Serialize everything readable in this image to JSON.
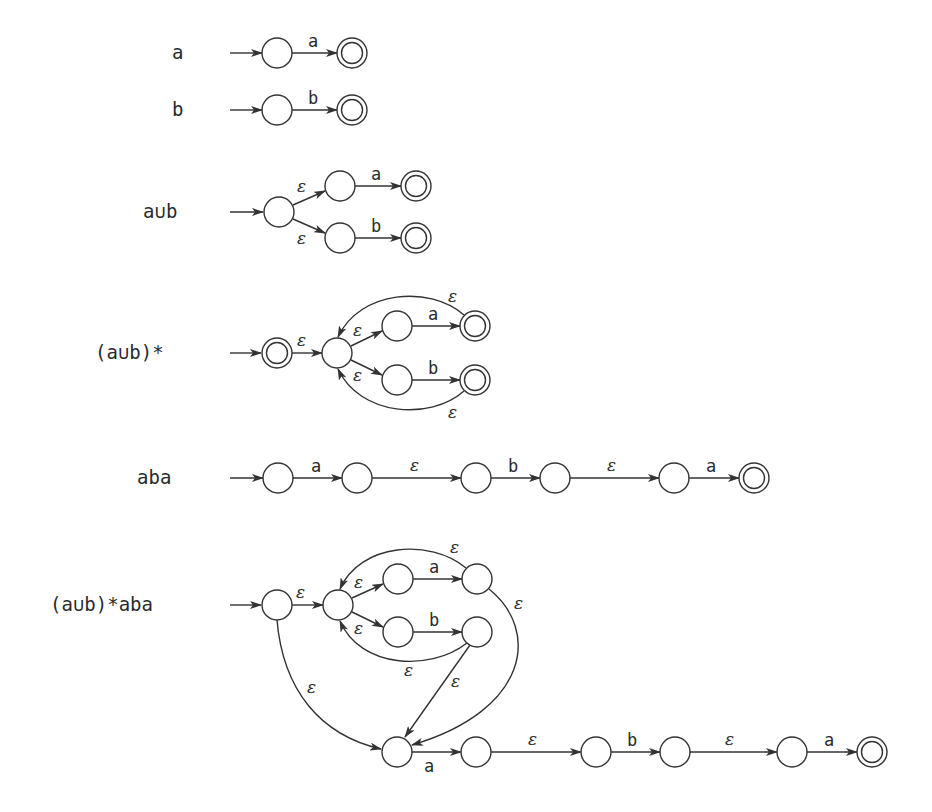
{
  "figure": {
    "rows": [
      {
        "regex": "a",
        "edges": [
          {
            "label": "a"
          }
        ]
      },
      {
        "regex": "b",
        "edges": [
          {
            "label": "b"
          }
        ]
      },
      {
        "regex": "a∪b",
        "edges": [
          {
            "label": "ε"
          },
          {
            "label": "ε"
          },
          {
            "label": "a"
          },
          {
            "label": "b"
          }
        ]
      },
      {
        "regex": "(a∪b)*",
        "edges": [
          {
            "label": "ε"
          },
          {
            "label": "ε"
          },
          {
            "label": "ε"
          },
          {
            "label": "a"
          },
          {
            "label": "b"
          },
          {
            "label": "ε"
          },
          {
            "label": "ε"
          }
        ]
      },
      {
        "regex": "aba",
        "edges": [
          {
            "label": "a"
          },
          {
            "label": "ε"
          },
          {
            "label": "b"
          },
          {
            "label": "ε"
          },
          {
            "label": "a"
          }
        ]
      },
      {
        "regex": "(a∪b)*aba",
        "edges": [
          {
            "label": "ε"
          },
          {
            "label": "ε"
          },
          {
            "label": "ε"
          },
          {
            "label": "a"
          },
          {
            "label": "b"
          },
          {
            "label": "ε"
          },
          {
            "label": "ε"
          },
          {
            "label": "ε"
          },
          {
            "label": "ε"
          },
          {
            "label": "ε"
          },
          {
            "label": "a"
          },
          {
            "label": "ε"
          },
          {
            "label": "b"
          },
          {
            "label": "ε"
          },
          {
            "label": "a"
          }
        ]
      }
    ]
  },
  "colors": {
    "stroke": "#333333",
    "background": "#ffffff"
  }
}
